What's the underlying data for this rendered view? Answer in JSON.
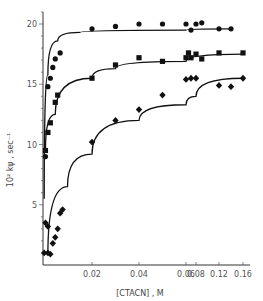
{
  "chart_data": {
    "type": "scatter",
    "title": "",
    "xlabel": "[CTACN] , M",
    "ylabel": "10² kψ , sec⁻¹",
    "x_ticks": [
      "0.02",
      "0.04",
      "0.06",
      "0.08",
      "0.12",
      "0.16"
    ],
    "x_tick_values": [
      0.02,
      0.04,
      0.06,
      0.08,
      0.12,
      0.16
    ],
    "x_scale_note": "non-linear/compressed axis beyond 0.06",
    "y_ticks": [
      "5",
      "10",
      "15",
      "20"
    ],
    "y_tick_values": [
      5,
      10,
      15,
      20
    ],
    "ylim": [
      0,
      21
    ],
    "grid": false,
    "legend": "none",
    "series": [
      {
        "name": "circles",
        "marker": "circle",
        "points": [
          [
            0.001,
            9.0
          ],
          [
            0.002,
            14.8
          ],
          [
            0.003,
            15.5
          ],
          [
            0.004,
            16.4
          ],
          [
            0.005,
            17.1
          ],
          [
            0.007,
            17.6
          ],
          [
            0.02,
            19.6
          ],
          [
            0.03,
            19.8
          ],
          [
            0.04,
            20.0
          ],
          [
            0.05,
            20.0
          ],
          [
            0.06,
            20.0
          ],
          [
            0.07,
            19.5
          ],
          [
            0.08,
            20.0
          ],
          [
            0.09,
            20.1
          ],
          [
            0.12,
            19.6
          ],
          [
            0.14,
            19.6
          ]
        ],
        "fit_curve": [
          [
            0.0005,
            5.5
          ],
          [
            0.002,
            15.8
          ],
          [
            0.006,
            18.6
          ],
          [
            0.015,
            19.3
          ],
          [
            0.06,
            19.5
          ],
          [
            0.14,
            19.6
          ]
        ]
      },
      {
        "name": "squares",
        "marker": "square",
        "points": [
          [
            0.001,
            9.5
          ],
          [
            0.002,
            11.0
          ],
          [
            0.003,
            11.8
          ],
          [
            0.005,
            13.5
          ],
          [
            0.006,
            14.1
          ],
          [
            0.02,
            15.5
          ],
          [
            0.03,
            16.6
          ],
          [
            0.04,
            17.2
          ],
          [
            0.05,
            16.9
          ],
          [
            0.06,
            17.2
          ],
          [
            0.065,
            17.6
          ],
          [
            0.07,
            17.2
          ],
          [
            0.08,
            17.5
          ],
          [
            0.09,
            17.1
          ],
          [
            0.12,
            17.6
          ],
          [
            0.16,
            17.6
          ]
        ],
        "fit_curve": [
          [
            0.001,
            9.5
          ],
          [
            0.005,
            12.5
          ],
          [
            0.02,
            15.5
          ],
          [
            0.03,
            16.3
          ],
          [
            0.06,
            16.9
          ],
          [
            0.16,
            17.5
          ]
        ]
      },
      {
        "name": "diamonds",
        "marker": "diamond",
        "points": [
          [
            0.0005,
            1.0
          ],
          [
            0.001,
            3.5
          ],
          [
            0.002,
            3.2
          ],
          [
            0.002,
            1.0
          ],
          [
            0.003,
            0.9
          ],
          [
            0.004,
            1.8
          ],
          [
            0.005,
            2.3
          ],
          [
            0.006,
            3.0
          ],
          [
            0.007,
            4.3
          ],
          [
            0.008,
            4.6
          ],
          [
            0.02,
            10.2
          ],
          [
            0.03,
            12.0
          ],
          [
            0.04,
            12.9
          ],
          [
            0.05,
            14.1
          ],
          [
            0.06,
            15.4
          ],
          [
            0.07,
            15.5
          ],
          [
            0.08,
            15.5
          ],
          [
            0.12,
            14.9
          ],
          [
            0.14,
            14.8
          ],
          [
            0.16,
            15.5
          ]
        ],
        "fit_curve": [
          [
            0.002,
            0.9
          ],
          [
            0.01,
            6.5
          ],
          [
            0.02,
            9.2
          ],
          [
            0.04,
            12.0
          ],
          [
            0.06,
            13.3
          ],
          [
            0.08,
            14.0
          ],
          [
            0.16,
            15.5
          ]
        ]
      }
    ]
  },
  "axes": {
    "xlabel": "[CTACN] , M",
    "ylabel": "10² kψ , sec⁻¹"
  }
}
